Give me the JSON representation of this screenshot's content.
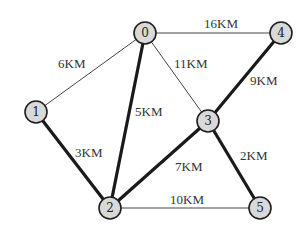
{
  "diagram": {
    "type": "weighted-graph",
    "nodes": [
      {
        "id": "0",
        "label": "0",
        "x": 145,
        "y": 33
      },
      {
        "id": "1",
        "label": "1",
        "x": 36,
        "y": 112
      },
      {
        "id": "2",
        "label": "2",
        "x": 110,
        "y": 208
      },
      {
        "id": "3",
        "label": "3",
        "x": 208,
        "y": 121
      },
      {
        "id": "4",
        "label": "4",
        "x": 281,
        "y": 33
      },
      {
        "id": "5",
        "label": "5",
        "x": 260,
        "y": 208
      }
    ],
    "edges": [
      {
        "from": "0",
        "to": "1",
        "weight": "6KM",
        "bold": false
      },
      {
        "from": "0",
        "to": "4",
        "weight": "16KM",
        "bold": false
      },
      {
        "from": "0",
        "to": "3",
        "weight": "11KM",
        "bold": false
      },
      {
        "from": "0",
        "to": "2",
        "weight": "5KM",
        "bold": true
      },
      {
        "from": "1",
        "to": "2",
        "weight": "3KM",
        "bold": true
      },
      {
        "from": "2",
        "to": "3",
        "weight": "7KM",
        "bold": true
      },
      {
        "from": "3",
        "to": "4",
        "weight": "9KM",
        "bold": true
      },
      {
        "from": "3",
        "to": "5",
        "weight": "2KM",
        "bold": true
      },
      {
        "from": "2",
        "to": "5",
        "weight": "10KM",
        "bold": false
      }
    ],
    "labels": {
      "e01": "6KM",
      "e04": "16KM",
      "e03": "11KM",
      "e02": "5KM",
      "e12": "3KM",
      "e23": "7KM",
      "e34": "9KM",
      "e35": "2KM",
      "e25": "10KM",
      "n0": "0",
      "n1": "1",
      "n2": "2",
      "n3": "3",
      "n4": "4",
      "n5": "5"
    },
    "colors": {
      "node_fill": "#d9d9d9",
      "node_stroke": "#1f1f1f",
      "edge": "#1a1a1a",
      "background": "#ffffff"
    }
  }
}
